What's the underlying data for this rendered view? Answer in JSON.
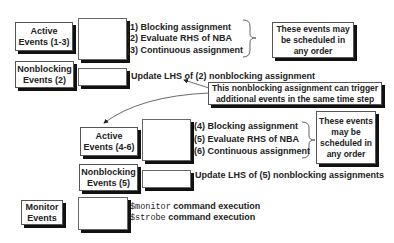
{
  "diagram": {
    "groups": [
      {
        "event_box": {
          "line1": "Active",
          "line2": "Events (1-3)"
        },
        "items": [
          "(1) Blocking assignment",
          "(2) Evaluate RHS of NBA",
          "(3) Continuous assignment"
        ],
        "note": {
          "line1": "These events may",
          "line2": "be scheduled in",
          "line3": "any order"
        }
      },
      {
        "event_box": {
          "line1": "Nonblocking",
          "line2": "Events (2)"
        },
        "items": [
          "Update LHS of (2) nonblocking assignment"
        ]
      },
      {
        "event_box": {
          "line1": "Active",
          "line2": "Events (4-6)"
        },
        "items": [
          "(4) Blocking assignment",
          "(5) Evaluate RHS of NBA",
          "(6) Continuous assignment"
        ],
        "note": {
          "line1": "These events",
          "line2": "may be",
          "line3": "scheduled in",
          "line4": "any order"
        }
      },
      {
        "event_box": {
          "line1": "Nonblocking",
          "line2": "Events (5)"
        },
        "items": [
          "Update LHS of (5) nonblocking assignments"
        ]
      },
      {
        "event_box": {
          "line1": "Monitor",
          "line2": "Events"
        },
        "items": [
          {
            "code": "$monitor",
            "text": " command execution"
          },
          {
            "code": "$strobe",
            "text": " command execution"
          }
        ]
      }
    ],
    "callout": {
      "line1": "This nonblocking assignment can trigger",
      "line2": "additional events in the same time step"
    }
  }
}
